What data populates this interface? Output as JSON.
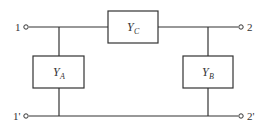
{
  "diagram": {
    "type": "two-port pi network",
    "terminals": {
      "port1_top": "1",
      "port1_bottom": "1'",
      "port2_top": "2",
      "port2_bottom": "2'"
    },
    "elements": {
      "series": {
        "symbol": "Y",
        "subscript": "C"
      },
      "shunt_left": {
        "symbol": "Y",
        "subscript": "A"
      },
      "shunt_right": {
        "symbol": "Y",
        "subscript": "B"
      }
    }
  }
}
